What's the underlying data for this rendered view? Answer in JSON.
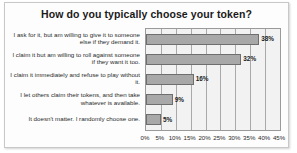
{
  "chart_data": {
    "type": "bar",
    "orientation": "horizontal",
    "title": "How do you typically choose your token?",
    "xlabel": "",
    "ylabel": "",
    "xlim": [
      0,
      45
    ],
    "xticks": [
      "0%",
      "5%",
      "10%",
      "15%",
      "20%",
      "25%",
      "30%",
      "35%",
      "40%",
      "45%"
    ],
    "xtick_values": [
      0,
      5,
      10,
      15,
      20,
      25,
      30,
      35,
      40,
      45
    ],
    "grid": true,
    "legend": false,
    "bar_color": "#a8a8a8",
    "bar_border_color": "#6e6e6e",
    "plot_background": "#f2f2f2",
    "categories": [
      "I ask for it, but am willing to give it to someone else if they demand it.",
      "I claim it but am willing to roll against someone if they want it too.",
      "I claim it immediately and refuse to play without it.",
      "I let others claim their tokens, and then take whatever is available.",
      "It doesn't matter. I randomly choose one."
    ],
    "values": [
      38,
      32,
      16,
      9,
      5
    ],
    "data_labels": [
      "38%",
      "32%",
      "16%",
      "9%",
      "5%"
    ]
  }
}
